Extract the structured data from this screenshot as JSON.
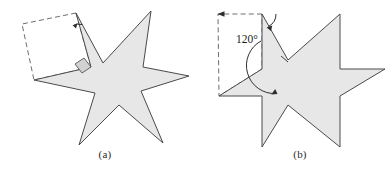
{
  "figure": {
    "type": "geometry-diagram",
    "background_color": "#ffffff",
    "fill_color": "#e7e7e7",
    "stroke_color": "#4a4a4a",
    "dashed_color": "#6e6e6e",
    "marker_fill": "#d2d2d2",
    "panels": [
      {
        "id": "a",
        "caption": "(a)",
        "star_kind": "irregular-six-pointed-star",
        "points": 6,
        "annotations": {
          "right_angle_marker": true,
          "rotation_arc_arrow": true,
          "dashed_overlay": "square",
          "angle_label": ""
        },
        "star_vertices": [
          [
            76,
            13
          ],
          [
            103,
            63
          ],
          [
            151,
            11
          ],
          [
            143,
            67
          ],
          [
            189,
            76
          ],
          [
            141,
            91
          ],
          [
            163,
            143
          ],
          [
            119,
            105
          ],
          [
            79,
            145
          ],
          [
            95,
            93
          ],
          [
            34,
            80
          ],
          [
            91,
            67
          ]
        ],
        "dashed_overlay_vertices": [
          [
            76,
            13
          ],
          [
            22,
            24
          ],
          [
            34,
            80
          ],
          [
            91,
            67
          ]
        ],
        "right_angle_marker_vertices": [
          [
            84,
            58
          ],
          [
            91,
            67
          ],
          [
            82,
            73
          ],
          [
            75,
            64
          ]
        ],
        "arc": {
          "center": [
            76,
            13
          ],
          "radius": 13,
          "start_deg": 62,
          "end_deg": 104,
          "arrowhead": true
        }
      },
      {
        "id": "b",
        "caption": "(b)",
        "star_kind": "regular-six-pointed-star",
        "points": 6,
        "annotations": {
          "right_angle_marker": false,
          "rotation_arc_arrow": true,
          "dashed_overlay": "parallelogram",
          "angle_label": "120°"
        },
        "star_vertices": [
          [
            262,
            14
          ],
          [
            288,
            60
          ],
          [
            340,
            14
          ],
          [
            340,
            69
          ],
          [
            385,
            69
          ],
          [
            340,
            96
          ],
          [
            340,
            147
          ],
          [
            288,
            105
          ],
          [
            262,
            147
          ],
          [
            262,
            96
          ],
          [
            219,
            96
          ],
          [
            262,
            69
          ]
        ],
        "dashed_overlay_vertices": [
          [
            262,
            14
          ],
          [
            218,
            14
          ],
          [
            219,
            96
          ],
          [
            262,
            69
          ]
        ],
        "arcs": [
          {
            "center": [
              262,
              14
            ],
            "radius": 14,
            "start_deg": 0,
            "end_deg": 62,
            "arrowhead": true
          },
          {
            "center": [
              262,
              69
            ],
            "radius": 28,
            "start_deg": 268,
            "end_deg": 330,
            "arrowhead": true
          }
        ],
        "angle_label_value": "120°",
        "angle_label_position": [
          236,
          33
        ]
      }
    ]
  }
}
